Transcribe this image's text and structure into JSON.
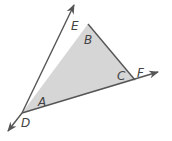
{
  "diagram": {
    "type": "geometry-triangle",
    "colors": {
      "fill": "#d6d6d6",
      "stroke": "#555555",
      "label": "#444444",
      "background": "#ffffff"
    },
    "vertices": {
      "top": {
        "x": 88,
        "y": 24
      },
      "right": {
        "x": 135,
        "y": 80
      },
      "bottom_left": {
        "x": 22,
        "y": 113
      }
    },
    "rays": [
      {
        "name": "ray-DE",
        "from": "D",
        "to": "E",
        "tip": {
          "x": 74,
          "y": 5
        }
      },
      {
        "name": "ray-DF",
        "from": "D",
        "to": "F",
        "tip": {
          "x": 158,
          "y": 72
        }
      },
      {
        "name": "ray-ED",
        "from": "E",
        "to": "D",
        "tip": {
          "x": 8,
          "y": 131
        }
      }
    ],
    "interior_angles": {
      "A": "A",
      "B": "B",
      "C": "C"
    },
    "points": {
      "D": "D",
      "E": "E",
      "F": "F"
    }
  }
}
